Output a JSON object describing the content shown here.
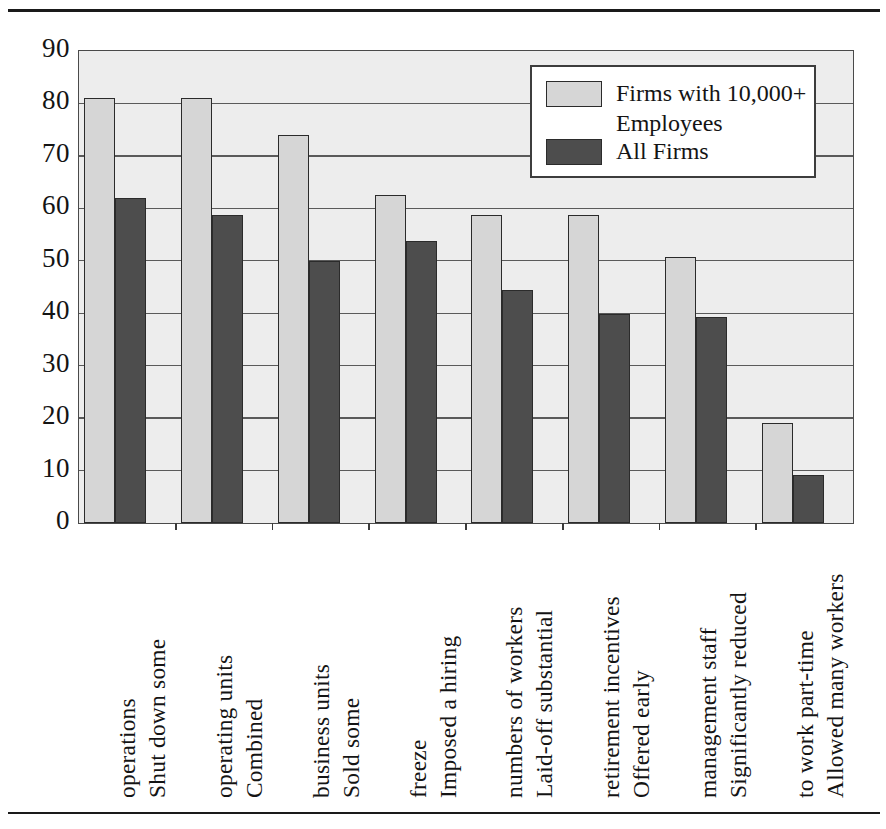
{
  "chart_data": {
    "type": "bar",
    "title": "",
    "subtitle": "",
    "xlabel": "",
    "ylabel": "",
    "ylim": [
      0,
      90
    ],
    "yticks": [
      "0",
      "10",
      "20",
      "30",
      "40",
      "50",
      "60",
      "70",
      "80",
      "90"
    ],
    "grid": true,
    "legend_position": "top-right",
    "categories": [
      "Shut down some operations",
      "Combined operating units",
      "Sold some business units",
      "Imposed a hiring freeze",
      "Laid-off substantial numbers of workers",
      "Offered early retirement incentives",
      "Significantly reduced management staff",
      "Allowed many workers to work part-time"
    ],
    "category_lines": [
      [
        "Shut down some",
        "operations"
      ],
      [
        "Combined",
        "operating units"
      ],
      [
        "Sold some",
        "business units"
      ],
      [
        "Imposed a hiring",
        "freeze"
      ],
      [
        "Laid-off substantial",
        "numbers of workers"
      ],
      [
        "Offered early",
        "retirement incentives"
      ],
      [
        "Significantly reduced",
        "management staff"
      ],
      [
        "Allowed many workers",
        "to work part-time"
      ]
    ],
    "series": [
      {
        "name": "Firms with 10,000+ Employees",
        "color": "#d6d6d6",
        "values": [
          81,
          81,
          74,
          62.5,
          58.7,
          58.7,
          50.7,
          19
        ]
      },
      {
        "name": "All Firms",
        "color": "#4d4d4d",
        "values": [
          62,
          58.7,
          50,
          53.8,
          44.4,
          39.8,
          39.2,
          9.2
        ]
      }
    ]
  },
  "legend": {
    "items": [
      {
        "label": "Firms with 10,000+\nEmployees",
        "swatch": "light"
      },
      {
        "label": "All Firms",
        "swatch": "dark"
      }
    ]
  },
  "axes": {
    "y_ticks": [
      "90",
      "80",
      "70",
      "60",
      "50",
      "40",
      "30",
      "20",
      "10",
      "0"
    ]
  },
  "colors": {
    "series_light": "#d6d6d6",
    "series_dark": "#4d4d4d",
    "plot_background": "#ededed",
    "gridline": "#5a5a5a",
    "axis_border": "#4a4a4a",
    "rule": "#1a1a1a",
    "text": "#141414"
  }
}
